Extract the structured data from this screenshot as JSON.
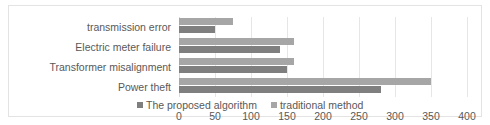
{
  "chart_data": {
    "type": "bar",
    "orientation": "horizontal",
    "title": "",
    "xlabel": "",
    "ylabel": "",
    "categories": [
      "transmission error",
      "Electric meter failure",
      "Transformer misalignment",
      "Power theft"
    ],
    "series": [
      {
        "name": "The proposed algorithm",
        "color": "#7f7f7f",
        "values": [
          50,
          140,
          150,
          280
        ]
      },
      {
        "name": "traditional method",
        "color": "#a6a6a6",
        "values": [
          75,
          160,
          160,
          350
        ]
      }
    ],
    "xlim": [
      0,
      400
    ],
    "xticks": [
      0,
      50,
      100,
      150,
      200,
      250,
      300,
      350,
      400
    ],
    "xtick_labels": [
      "0",
      "50",
      "100",
      "150",
      "200",
      "250",
      "300",
      "350",
      "400"
    ],
    "grid": true,
    "grid_axis": "x",
    "legend": [
      "The proposed algorithm",
      "traditional method"
    ],
    "legend_position": "bottom"
  },
  "legend": {
    "items": [
      {
        "label": "The proposed algorithm",
        "marker": "square-marker-icon"
      },
      {
        "label": "traditional method",
        "marker": "square-marker-icon"
      }
    ]
  }
}
